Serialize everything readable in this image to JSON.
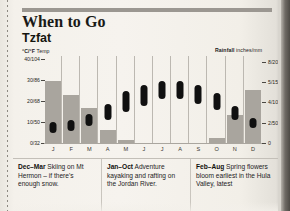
{
  "page": {
    "heading": "When to Go",
    "location": "Tzfat"
  },
  "axes": {
    "temp_label_bold": "°C/°F",
    "temp_label_light": " Temp",
    "rain_label_bold": "Rainfall",
    "rain_label_light": " inches/mm",
    "temp_ticks": [
      "40/104",
      "30/86",
      "20/68",
      "10/50",
      "0/32"
    ],
    "rain_ticks": [
      "8/200",
      "5/150",
      "4/100",
      "2/50",
      "0"
    ]
  },
  "chart_data": {
    "type": "bar",
    "xlabel": "",
    "ylabel": "°C/°F Temp",
    "y2label": "Rainfall inches/mm",
    "grid": false,
    "legend": "none",
    "categories": [
      "J",
      "F",
      "M",
      "A",
      "M",
      "J",
      "J",
      "A",
      "S",
      "O",
      "N",
      "D"
    ],
    "ylim": [
      0,
      40
    ],
    "y2lim": [
      0,
      8
    ],
    "series": [
      {
        "name": "Rainfall",
        "type": "bar",
        "unit": "inches",
        "values": [
          6.0,
          4.6,
          3.4,
          1.3,
          0.25,
          0,
          0,
          0,
          0,
          0.45,
          2.7,
          5.1
        ]
      },
      {
        "name": "Temperature range",
        "type": "range",
        "unit": "°C",
        "low": [
          5,
          6,
          8,
          11,
          15,
          18,
          21,
          21,
          19,
          16,
          11,
          7
        ],
        "high": [
          10,
          11,
          14,
          19,
          25,
          28,
          30,
          30,
          28,
          24,
          18,
          12
        ]
      }
    ]
  },
  "tips": [
    {
      "name": "tip-skiing",
      "range": "Dec–Mar",
      "text": " Skiing on Mt Hermon – if there's enough snow."
    },
    {
      "name": "tip-rafting",
      "range": "Jan–Oct",
      "text": " Adventure kayaking and rafting on the Jordan River."
    },
    {
      "name": "tip-flowers",
      "range": "Feb–Aug",
      "text": " Spring flowers bloom earliest in the Hula Valley, latest"
    }
  ]
}
